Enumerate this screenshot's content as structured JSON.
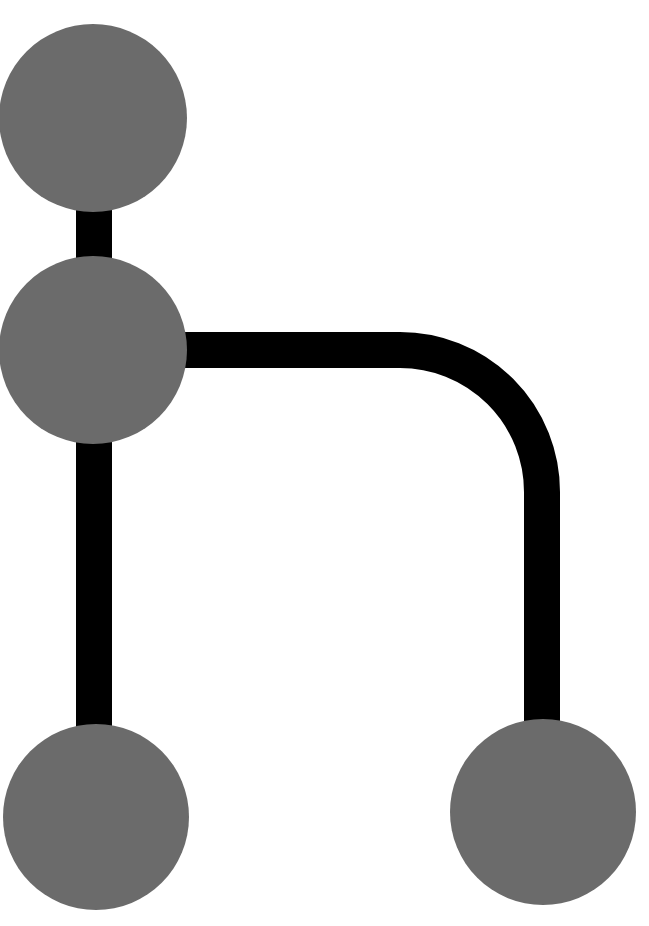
{
  "diagram": {
    "type": "git-branch-graph",
    "colors": {
      "node": "#6b6b6b",
      "edge": "#000000",
      "background": "#ffffff"
    },
    "nodes": [
      {
        "id": "commit-top",
        "cx": 93,
        "cy": 118,
        "r": 94
      },
      {
        "id": "commit-branch-point",
        "cx": 93,
        "cy": 350,
        "r": 94
      },
      {
        "id": "commit-main-tip",
        "cx": 96,
        "cy": 817,
        "r": 93
      },
      {
        "id": "commit-branch-tip",
        "cx": 543,
        "cy": 812,
        "r": 93
      }
    ],
    "edges": [
      {
        "id": "main-line",
        "from": "commit-top",
        "to": "commit-main-tip"
      },
      {
        "id": "branch-line",
        "from": "commit-branch-point",
        "to": "commit-branch-tip"
      }
    ]
  }
}
